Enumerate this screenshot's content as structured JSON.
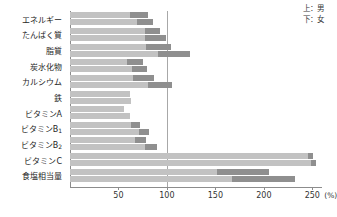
{
  "legend": {
    "top_label": "上：男",
    "bottom_label": "下：女"
  },
  "axis": {
    "unit": "(%)",
    "ticks": [
      50,
      100,
      150,
      200,
      250
    ],
    "tick_labels": [
      "50",
      "100",
      "150",
      "200",
      "250"
    ],
    "reference_value": 100,
    "xmin": 0,
    "xmax": 260
  },
  "chart_data": {
    "type": "bar",
    "orientation": "horizontal",
    "title": "",
    "xlabel": "(%)",
    "ylabel": "",
    "xlim": [
      0,
      260
    ],
    "grid": false,
    "legend_position": "top-right",
    "reference_line": 100,
    "categories": [
      "エネルギー",
      "たんぱく質",
      "脂質",
      "炭水化物",
      "カルシウム",
      "鉄",
      "ビタミンA",
      "ビタミンB1",
      "ビタミンB2",
      "ビタミンC",
      "食塩相当量"
    ],
    "series": [
      {
        "name": "上：男",
        "values": [
          80,
          93,
          104,
          75,
          87,
          62,
          56,
          72,
          78,
          251,
          205
        ]
      },
      {
        "name": "下：女",
        "values": [
          86,
          99,
          124,
          79,
          105,
          63,
          62,
          82,
          90,
          254,
          232
        ]
      }
    ],
    "segment_note": "each bar drawn as light body with darker tip segment",
    "tip_fractions": [
      [
        0.22,
        0.2
      ],
      [
        0.17,
        0.22
      ],
      [
        0.25,
        0.27
      ],
      [
        0.21,
        0.19
      ],
      [
        0.25,
        0.23
      ],
      [
        0.0,
        0.0
      ],
      [
        0.0,
        0.0
      ],
      [
        0.13,
        0.13
      ],
      [
        0.14,
        0.14
      ],
      [
        0.02,
        0.02
      ],
      [
        0.26,
        0.28
      ]
    ],
    "colors": {
      "bar_body": "#c2c2c2",
      "bar_tip": "#8f8f8f",
      "axis": "#8c8c8c",
      "reference_line": "#a8a8a8",
      "text": "#262626"
    }
  }
}
